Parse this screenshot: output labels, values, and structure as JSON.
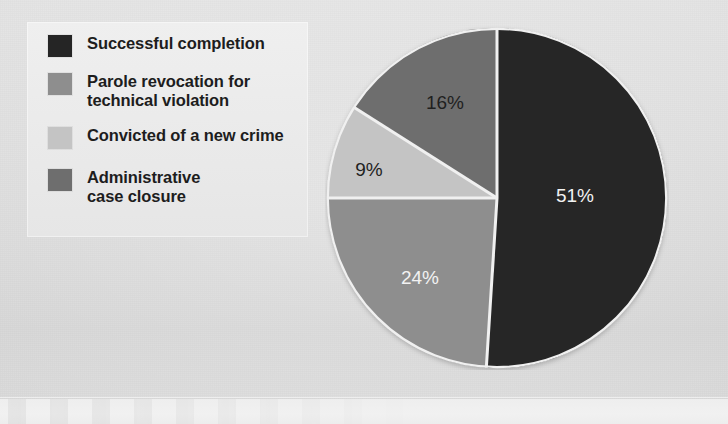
{
  "figure": {
    "background_color": "#dcdcdc",
    "legend_panel_color": "#eaeaea"
  },
  "legend": {
    "items": [
      {
        "label": "Successful completion",
        "color": "#252525",
        "swatch_name": "legend-swatch-successful-completion"
      },
      {
        "label": "Parole revocation for\ntechnical violation",
        "color": "#8e8e8e",
        "swatch_name": "legend-swatch-parole-revocation"
      },
      {
        "label": "Convicted of a new crime",
        "color": "#c4c4c4",
        "swatch_name": "legend-swatch-convicted-new-crime"
      },
      {
        "label": "Administrative\ncase closure",
        "color": "#6e6e6e",
        "swatch_name": "legend-swatch-administrative-closure"
      }
    ]
  },
  "pie": {
    "center_x": 172,
    "center_y": 172,
    "radius": 170,
    "separator_color": "#f0f0f0",
    "separator_width": 3,
    "labels": [
      {
        "text": "51%",
        "x": 250,
        "y": 171,
        "tone": "light"
      },
      {
        "text": "24%",
        "x": 95,
        "y": 253,
        "tone": "light"
      },
      {
        "text": "9%",
        "x": 44,
        "y": 145,
        "tone": "dark"
      },
      {
        "text": "16%",
        "x": 120,
        "y": 78,
        "tone": "dark"
      }
    ]
  },
  "chart_data": {
    "type": "pie",
    "title": "",
    "categories": [
      "Successful completion",
      "Parole revocation for technical violation",
      "Convicted of a new crime",
      "Administrative case closure"
    ],
    "values": [
      51,
      24,
      9,
      16
    ],
    "value_labels": [
      "51%",
      "24%",
      "9%",
      "16%"
    ],
    "unit": "percent",
    "colors": [
      "#252525",
      "#8e8e8e",
      "#c4c4c4",
      "#6e6e6e"
    ],
    "start_angle_deg": 0,
    "direction": "clockwise",
    "legend_position": "left",
    "grid": false,
    "slice_order_clockwise_from_top": [
      {
        "category": "Successful completion",
        "value": 51,
        "color": "#252525"
      },
      {
        "category": "Parole revocation for technical violation",
        "value": 24,
        "color": "#8e8e8e"
      },
      {
        "category": "Convicted of a new crime",
        "value": 9,
        "color": "#c4c4c4"
      },
      {
        "category": "Administrative case closure",
        "value": 16,
        "color": "#6e6e6e"
      }
    ]
  }
}
